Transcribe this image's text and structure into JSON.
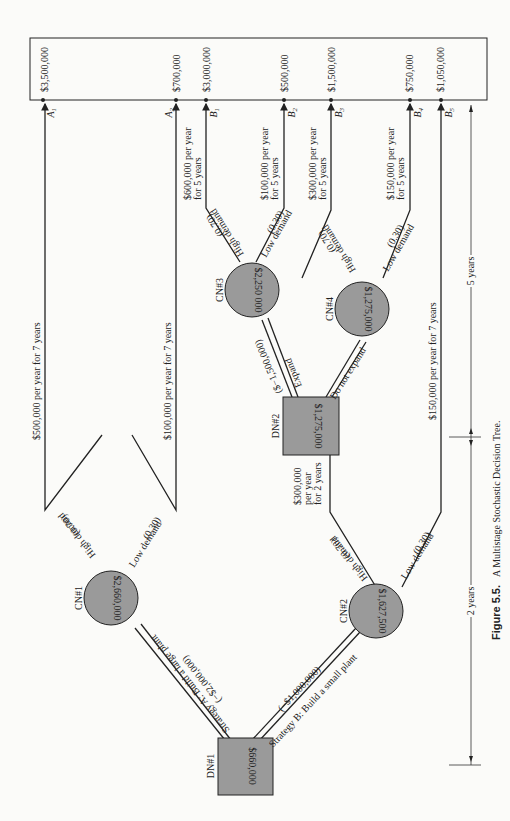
{
  "figure": {
    "caption_label": "Figure 5.5.",
    "caption_text": "A Multistage Stochastic Decision Tree."
  },
  "outcomes": [
    {
      "id": "A",
      "sub": "1",
      "value": "$3,500,000"
    },
    {
      "id": "A",
      "sub": "2",
      "value": "$700,000"
    },
    {
      "id": "B",
      "sub": "1",
      "value": "$3,000,000"
    },
    {
      "id": "B",
      "sub": "2",
      "value": "$500,000"
    },
    {
      "id": "B",
      "sub": "3",
      "value": "$1,500,000"
    },
    {
      "id": "B",
      "sub": "4",
      "value": "$750,000"
    },
    {
      "id": "B",
      "sub": "5",
      "value": "$1,050,000"
    }
  ],
  "nodes": {
    "dn1": {
      "label": "DN#1",
      "value": "$660,000"
    },
    "dn2": {
      "label": "DN#2",
      "value": "$1,275,000"
    },
    "cn1": {
      "label": "CN#1",
      "value": "$2,660,000"
    },
    "cn2": {
      "label": "CN#2",
      "value": "$1,627,500"
    },
    "cn3": {
      "label": "CN#3",
      "value": "$2,250 000"
    },
    "cn4": {
      "label": "CN#4",
      "value": "$1,275,000"
    }
  },
  "branches": {
    "strategy_a": {
      "label": "Strategy A:  Build a large plant",
      "cost": "(−$2,000,000)"
    },
    "strategy_b": {
      "label": "Strategy B:  Build a small plant",
      "cost": "(−$1,000,000)"
    },
    "expand": {
      "label": "Expand",
      "cost": "($−1,500,000)"
    },
    "no_expand": {
      "label": "Do not expand"
    },
    "high": "High demand",
    "low": "Low demand",
    "p_high": "(0.70)",
    "p_low": "(0.30)"
  },
  "payoffs": {
    "a1": "$500,000 per year for 7 years",
    "a2": "$100,000 per year for 7 years",
    "b1_line1": "$600,000 per year",
    "b1_line2": "for 5 years",
    "b2_line1": "$100,000 per year",
    "b2_line2": "for 5 years",
    "b3_line1": "$300,000 per year",
    "b3_line2": "for 5 years",
    "b4_line1": "$150,000 per year",
    "b4_line2": "for 5 years",
    "b5": "$150,000 per year for 7 years",
    "dn2_line1": "$300,000",
    "dn2_line2": "per year",
    "dn2_line3": "for 2 years"
  },
  "timeline": {
    "first": "2 years",
    "second": "5 years"
  }
}
